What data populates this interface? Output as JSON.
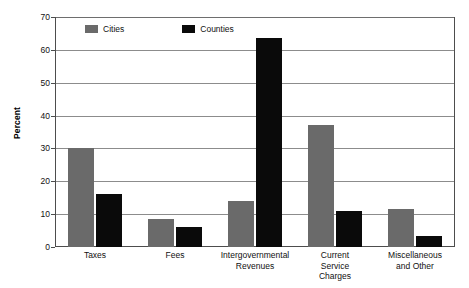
{
  "chart_data": {
    "type": "bar",
    "title": "",
    "subtitle": "",
    "xlabel": "",
    "ylabel": "Percent",
    "ylim": [
      0,
      70
    ],
    "ytick_step": 10,
    "yticks": [
      70,
      60,
      50,
      40,
      30,
      20,
      10,
      0
    ],
    "ytick_labels": [
      "70",
      "60",
      "50",
      "40",
      "30",
      "20",
      "10",
      "0"
    ],
    "grid": true,
    "grid_axis": "y",
    "legend_position": "top-left-inside",
    "categories": [
      "Taxes",
      "Intergovernmental Revenues",
      "Fees",
      "Current Service Charges",
      "Miscellaneous and Other"
    ],
    "category_lines": [
      [
        "Taxes"
      ],
      [
        "Fees"
      ],
      [
        "Intergovernmental",
        "Revenues"
      ],
      [
        "Current",
        "Service",
        "Charges"
      ],
      [
        "Miscellaneous",
        "and Other"
      ]
    ],
    "series": [
      {
        "name": "Cities",
        "color": "#6a6a6a",
        "values": [
          30,
          8.5,
          14,
          37,
          11.5
        ]
      },
      {
        "name": "Counties",
        "color": "#0a0a0a",
        "values": [
          16,
          6,
          63.5,
          11,
          3.5
        ]
      }
    ]
  },
  "colors": {
    "cities": "#6a6a6a",
    "counties": "#0a0a0a",
    "gridline": "#8c8c8c",
    "axis": "#4d4d4d",
    "background": "#ffffff"
  }
}
